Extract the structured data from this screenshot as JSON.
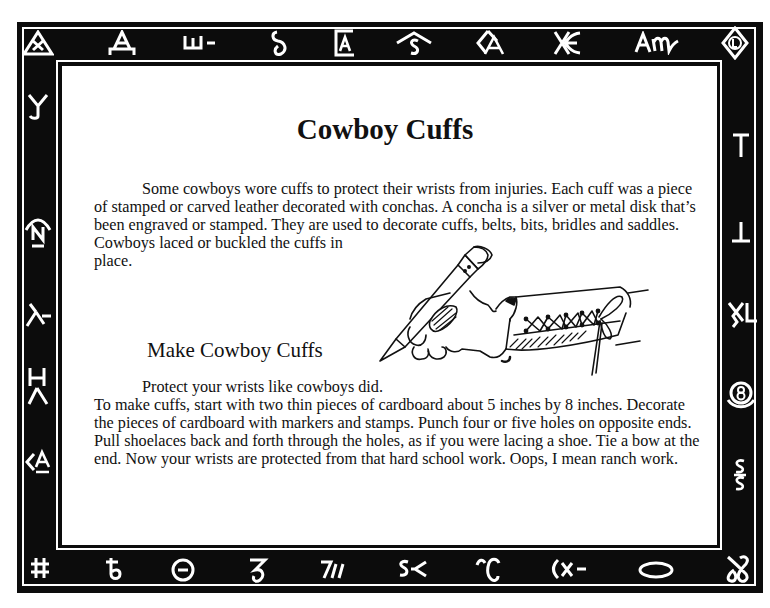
{
  "document": {
    "title": "Cowboy Cuffs",
    "intro": {
      "line1": "Some cowboys wore cuffs to protect their wrists from injuries. Each cuff was a piece",
      "line2": "of stamped or carved leather decorated with conchas. A concha is a silver or metal disk that’s",
      "line3": "been engraved or stamped. They are used to decorate cuffs, belts, bits, bridles and saddles.",
      "line4": "Cowboys laced or buckled the cuffs in",
      "line5": "place."
    },
    "activity": {
      "heading": "Make Cowboy Cuffs",
      "lead": "Protect your wrists like cowboys did.",
      "line1": "To make cuffs, start with two thin pieces of cardboard about 5 inches by 8 inches. Decorate",
      "line2": "the pieces of cardboard with markers and stamps. Punch four or five holes on opposite ends.",
      "line3": "Pull shoelaces back and forth through the holes, as if you were lacing a shoe. Tie a bow at the",
      "line4": "end. Now your wrists are protected from that hard school work. Oops, I mean ranch work."
    },
    "illustration": {
      "description": "hand holding a pencil wearing a laced leather cuff"
    }
  },
  "border": {
    "colors": {
      "frame": "#0c0c0c",
      "lines": "#ffffff",
      "panel": "#ffffff"
    },
    "top": [
      "triangle-X",
      "A-bar",
      "W-dash",
      "curly-S",
      "boxed-A",
      "rafter-S",
      "diamond-A",
      "X-E",
      "A-M",
      "diamond-L"
    ],
    "top_text": [
      "",
      "A",
      "ш-",
      "ℓ",
      "A",
      "S",
      "A",
      "Ӿ",
      "Aᵯ",
      "L"
    ],
    "right": [
      "T",
      "⊥",
      "XL",
      "8",
      "S/S"
    ],
    "bottom": [
      "#",
      "ᵬ",
      "⊖",
      "Ꝣ",
      "7//",
      "S≺",
      "Ͳ",
      "(x-",
      "O",
      "Ꝏ"
    ],
    "bottom_text": [
      "#",
      "ቴ",
      "⊖",
      "Ꞁ",
      "7//",
      "S≺",
      "Ꞇ",
      "(x-",
      "",
      "Ꝍ"
    ],
    "left": [
      "Y-hook",
      "N-rafter",
      "lazy-Y",
      "H-Y",
      "<A"
    ],
    "left_text": [
      "Ꭹ",
      "N",
      "⅄-",
      "HY",
      "<A"
    ]
  }
}
